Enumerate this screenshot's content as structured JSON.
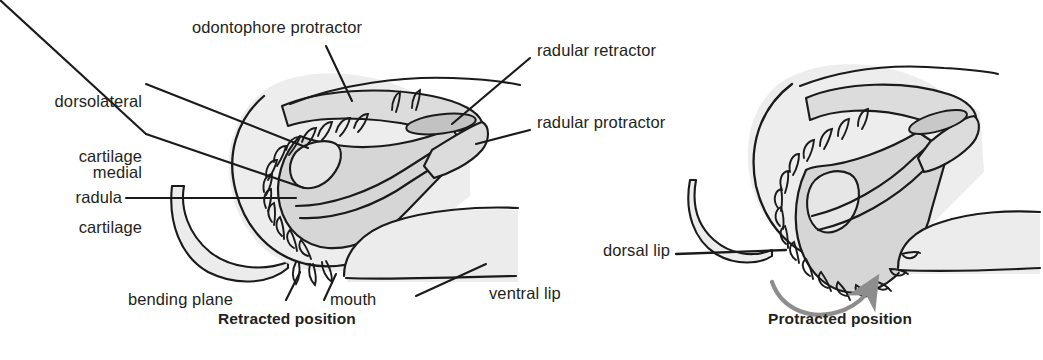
{
  "figure": {
    "title_alt": "Gastropod odontophore and radula in retracted and protracted positions",
    "colors": {
      "ink": "#231f20",
      "stroke": "#1a1a1a",
      "fill_light": "#ebebeb",
      "fill_mid": "#d9d9d9",
      "fill_dark": "#c8c8c8",
      "arrow": "#8d8d8d",
      "background": "#ffffff"
    }
  },
  "panels": [
    {
      "id": "retracted",
      "caption": "Retracted position",
      "labels": [
        {
          "key": "odontophore-protractor",
          "text": "odontophore protractor",
          "align": "left"
        },
        {
          "key": "dorsolateral-cartilage",
          "text": "dorsolateral\ncartilage",
          "align": "right"
        },
        {
          "key": "medial-cartilage",
          "text": "medial\ncartilage",
          "align": "right"
        },
        {
          "key": "radula",
          "text": "radula",
          "align": "right"
        },
        {
          "key": "bending-plane",
          "text": "bending plane",
          "align": "left"
        },
        {
          "key": "mouth",
          "text": "mouth",
          "align": "left"
        },
        {
          "key": "ventral-lip",
          "text": "ventral lip",
          "align": "left"
        },
        {
          "key": "radular-retractor",
          "text": "radular retractor",
          "align": "left"
        },
        {
          "key": "radular-protractor",
          "text": "radular protractor",
          "align": "left"
        }
      ]
    },
    {
      "id": "protracted",
      "caption": "Protracted position",
      "labels": [
        {
          "key": "dorsal-lip",
          "text": "dorsal lip",
          "align": "right"
        }
      ],
      "annotations": [
        {
          "key": "protraction-arrow",
          "text": "curved motion arrow"
        }
      ]
    }
  ],
  "label_text": {
    "odontophore_protractor": "odontophore protractor",
    "dorsolateral_cartilage_line1": "dorsolateral",
    "dorsolateral_cartilage_line2": "cartilage",
    "medial_cartilage_line1": "medial",
    "medial_cartilage_line2": "cartilage",
    "radula": "radula",
    "bending_plane": "bending plane",
    "mouth": "mouth",
    "ventral_lip": "ventral lip",
    "radular_retractor": "radular retractor",
    "radular_protractor": "radular protractor",
    "dorsal_lip": "dorsal lip",
    "caption_left": "Retracted position",
    "caption_right": "Protracted position"
  }
}
